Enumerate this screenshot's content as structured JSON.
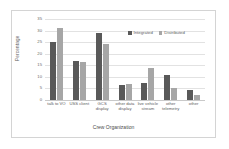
{
  "chart_data": {
    "type": "bar",
    "title": "",
    "xlabel": "Crew Organization",
    "ylabel": "Percentage",
    "ylim": [
      0,
      35
    ],
    "yticks": [
      0,
      5,
      10,
      15,
      20,
      25,
      30,
      35
    ],
    "ytick_labels": [
      "0",
      "5",
      "10",
      "15",
      "20",
      "25",
      "30",
      "35"
    ],
    "grid": true,
    "legend_position": "top-right-inside",
    "categories": [
      "talk to VO",
      "USS client",
      "GCS display",
      "other data display",
      "live vehicle stream",
      "other telemetry",
      "other"
    ],
    "series": [
      {
        "name": "Integrated",
        "color": "#595959",
        "values": [
          25,
          17,
          29,
          6.5,
          7.5,
          11,
          4.5
        ]
      },
      {
        "name": "Distributed",
        "color": "#a6a6a6",
        "values": [
          31,
          16.5,
          24,
          7,
          14,
          5,
          2
        ]
      }
    ]
  }
}
